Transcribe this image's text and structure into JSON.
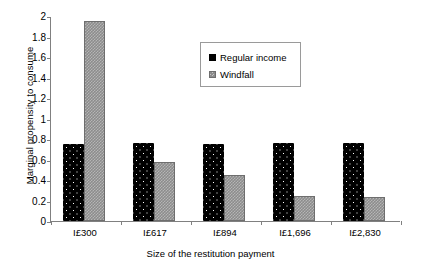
{
  "chart_data": {
    "type": "bar",
    "title": "",
    "subtitle": "",
    "xlabel": "Size of the restitution payment",
    "ylabel": "Marginal propensity to consume",
    "categories": [
      "I£300",
      "I£617",
      "I£894",
      "I£1,696",
      "I£2,830"
    ],
    "series": [
      {
        "name": "Regular income",
        "values": [
          0.75,
          0.76,
          0.75,
          0.76,
          0.76
        ],
        "color": "#000000",
        "pattern": "black-with-white-dots"
      },
      {
        "name": "Windfall",
        "values": [
          1.95,
          0.58,
          0.45,
          0.24,
          0.23
        ],
        "color": "#8c8c8c",
        "pattern": "gray-checkered"
      }
    ],
    "ylim": [
      0,
      2
    ],
    "yticks": [
      "0",
      "0.2",
      "0.4",
      "0.6",
      "0.8",
      "1",
      "1.2",
      "1.4",
      "1.6",
      "1.8",
      "2"
    ],
    "ytick_values": [
      0,
      0.2,
      0.4,
      0.6,
      0.8,
      1,
      1.2,
      1.4,
      1.6,
      1.8,
      2
    ],
    "grid": false,
    "legend_position": "inside-top-center"
  },
  "legend": {
    "items": [
      {
        "label": "Regular income",
        "swatch": "regular-income-swatch"
      },
      {
        "label": "Windfall",
        "swatch": "windfall-swatch"
      }
    ]
  }
}
